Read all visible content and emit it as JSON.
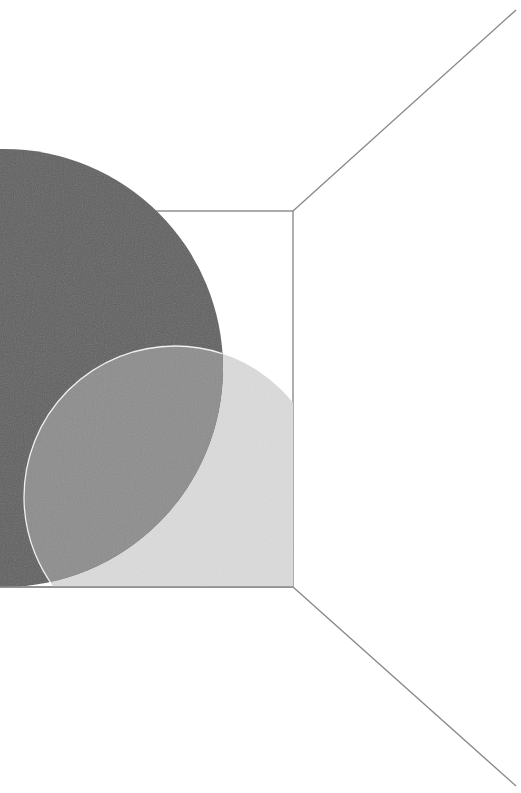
{
  "figure": {
    "type": "abstract-geometric-illustration",
    "colors": {
      "background": "#ffffff",
      "line": "#8a8a8a",
      "dark_circle": "#5e5e5e",
      "light_circle": "#dcdcdc",
      "overlap": "#8c8c8c",
      "overlap_outline": "#f0f0f0"
    },
    "shapes": {
      "inner_rectangle": {
        "x1": 0,
        "y1": 211,
        "x2": 293,
        "y2": 587
      },
      "diagonal_top": {
        "x1": 293,
        "y1": 211,
        "x2": 516,
        "y2": 10
      },
      "diagonal_bottom": {
        "x1": 293,
        "y1": 587,
        "x2": 516,
        "y2": 786
      },
      "dark_circle": {
        "cx": 4,
        "cy": 368,
        "r": 219
      },
      "light_circle": {
        "cx": 175,
        "cy": 497,
        "r": 151
      }
    }
  }
}
